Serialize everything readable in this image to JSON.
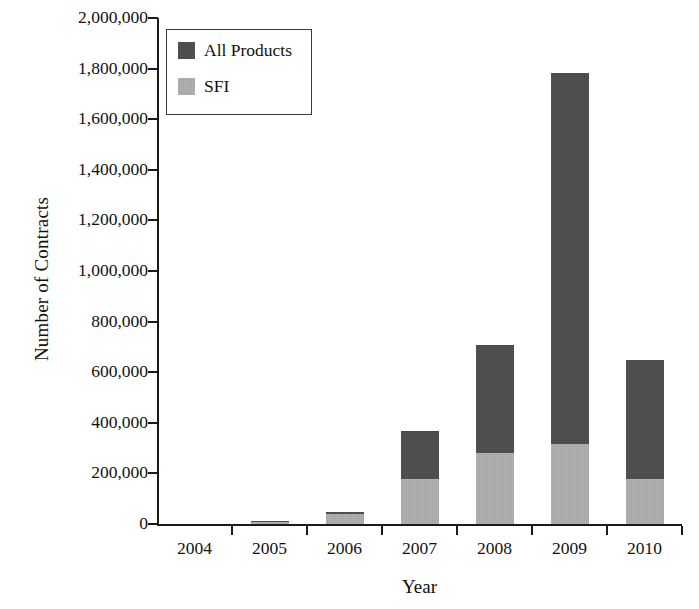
{
  "chart_data": {
    "type": "bar",
    "subtype": "stacked-vertical",
    "title": "",
    "xlabel": "Year",
    "ylabel": "Number of Contracts",
    "categories": [
      "2004",
      "2005",
      "2006",
      "2007",
      "2008",
      "2009",
      "2010"
    ],
    "series": [
      {
        "name": "SFI",
        "color": "#a3a3a3",
        "values": [
          0,
          8000,
          38000,
          178000,
          281000,
          316000,
          178000
        ]
      },
      {
        "name": "All Products",
        "color": "#464646",
        "values": [
          0,
          4000,
          10000,
          190000,
          427000,
          1467000,
          470000
        ]
      }
    ],
    "totals": [
      0,
      12000,
      48000,
      368000,
      708000,
      1783000,
      648000
    ],
    "stack_order": [
      "SFI",
      "All Products"
    ],
    "ylim": [
      0,
      2000000
    ],
    "ytick_values": [
      0,
      200000,
      400000,
      600000,
      800000,
      1000000,
      1200000,
      1400000,
      1600000,
      1800000,
      2000000
    ],
    "ytick_labels": [
      "0",
      "200,000",
      "400,000",
      "600,000",
      "800,000",
      "1,000,000",
      "1,200,000",
      "1,400,000",
      "1,600,000",
      "1,800,000",
      "2,000,000"
    ],
    "grid": false,
    "legend_position": "top-left",
    "legend_entries": [
      {
        "label": "All Products",
        "color": "#464646"
      },
      {
        "label": "SFI",
        "color": "#a3a3a3"
      }
    ]
  },
  "axes": {
    "y_axis_label": "Number of Contracts",
    "x_axis_label": "Year"
  },
  "legend": {
    "items": [
      {
        "label": "All Products"
      },
      {
        "label": "SFI"
      }
    ]
  },
  "colors": {
    "all_products": "#464646",
    "sfi": "#a3a3a3",
    "axis": "#1a1a1a",
    "background": "#ffffff"
  },
  "geometry": {
    "plot_left": 157,
    "plot_right": 682,
    "plot_top": 18,
    "plot_bottom": 524
  }
}
